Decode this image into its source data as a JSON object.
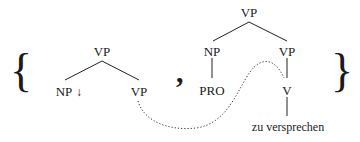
{
  "diagram": {
    "open_brace": "{",
    "close_brace": "}",
    "separator": ",",
    "left_tree": {
      "root": "VP",
      "left_child": "NP",
      "left_child_marker": "↓",
      "right_child": "VP"
    },
    "right_tree": {
      "root": "VP",
      "left_child": "NP",
      "left_grandchild": "PRO",
      "right_child": "VP",
      "right_grandchild": "V",
      "leaf": "zu versprechen"
    },
    "link": {
      "from": "left_tree.right_child",
      "to": "right_tree.right_grandchild",
      "style": "dotted"
    }
  }
}
